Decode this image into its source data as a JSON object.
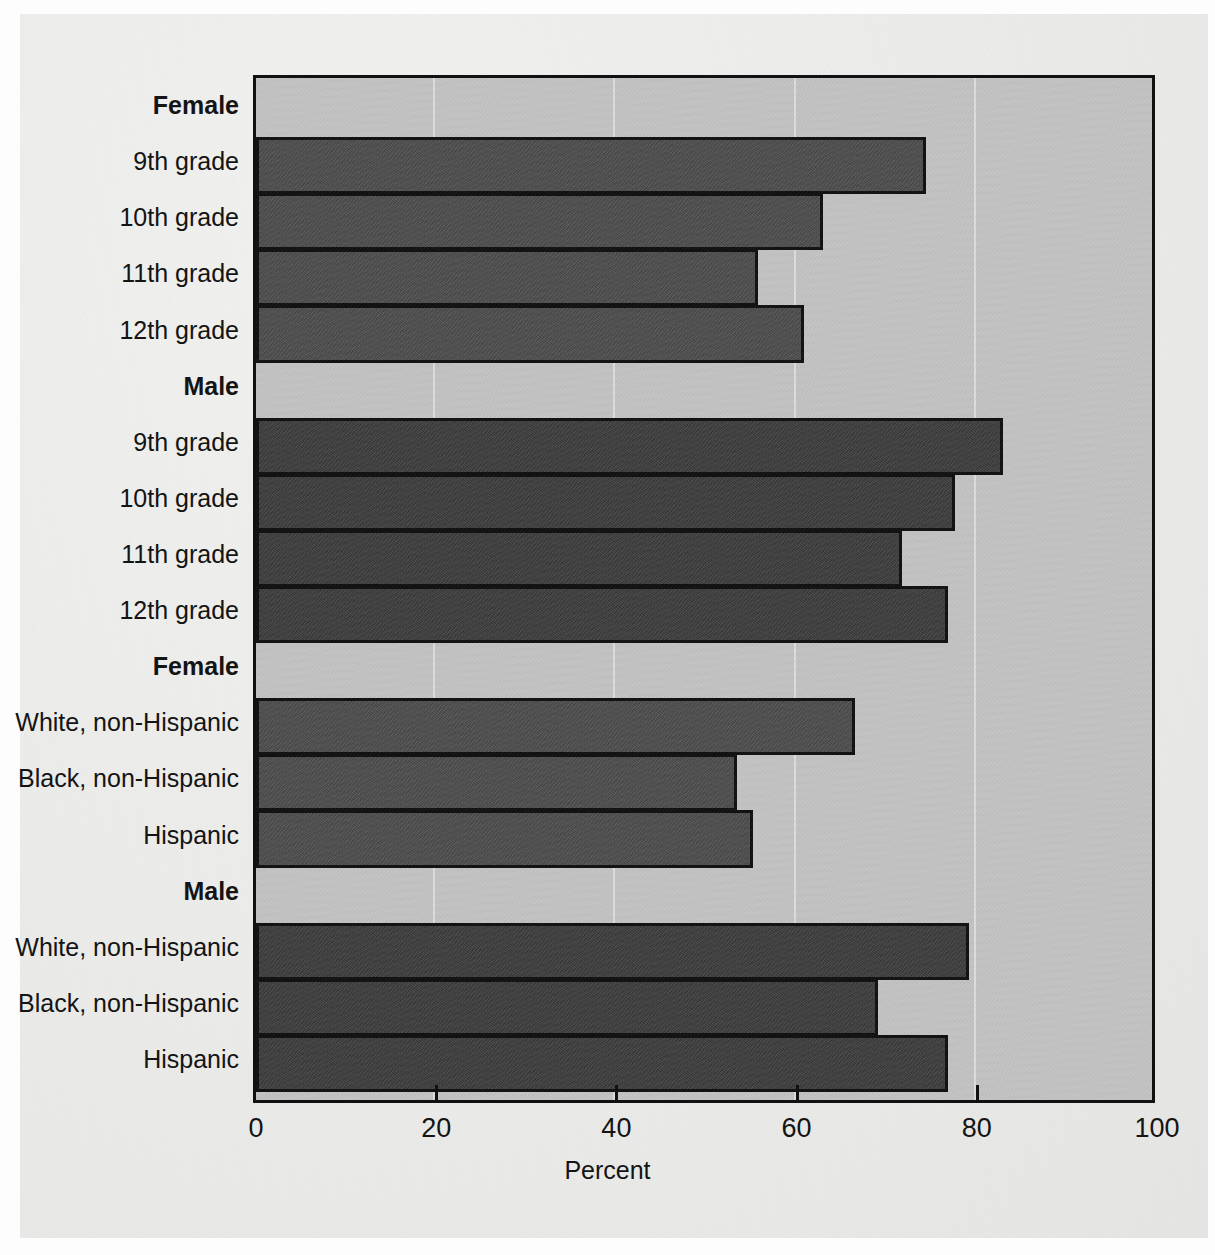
{
  "figure": {
    "axis_title": "Percent",
    "background_color": "#c3c3c3",
    "female_bar_color": "#4b4b4b",
    "male_bar_color": "#3a3a3a"
  },
  "chart_data": {
    "type": "bar",
    "orientation": "horizontal",
    "title": "",
    "subtitle": "",
    "xlabel": "Percent",
    "ylabel": "",
    "xlim": [
      0,
      100
    ],
    "xticks": [
      0,
      20,
      40,
      60,
      80,
      100
    ],
    "xticklabels": [
      "0",
      "20",
      "40",
      "60",
      "80",
      "100"
    ],
    "grid": "vertical",
    "legend": "none",
    "groups": [
      {
        "name": "Female",
        "series": "female",
        "categories": [
          "9th grade",
          "10th grade",
          "11th grade",
          "12th grade"
        ],
        "values": [
          74.0,
          62.6,
          55.4,
          60.5
        ]
      },
      {
        "name": "Male",
        "series": "male",
        "categories": [
          "9th grade",
          "10th grade",
          "11th grade",
          "12th grade"
        ],
        "values": [
          82.6,
          77.3,
          71.4,
          76.5
        ]
      },
      {
        "name": "Female",
        "series": "female",
        "categories": [
          "White, non-Hispanic",
          "Black, non-Hispanic",
          "Hispanic"
        ],
        "values": [
          66.2,
          53.0,
          54.8
        ]
      },
      {
        "name": "Male",
        "series": "male",
        "categories": [
          "White, non-Hispanic",
          "Black, non-Hispanic",
          "Hispanic"
        ],
        "values": [
          78.8,
          68.7,
          76.5
        ]
      }
    ],
    "rows": [
      {
        "label": "Female",
        "kind": "group",
        "series": "female"
      },
      {
        "label": "9th grade",
        "kind": "bar",
        "series": "female",
        "value": 74.0
      },
      {
        "label": "10th grade",
        "kind": "bar",
        "series": "female",
        "value": 62.6
      },
      {
        "label": "11th grade",
        "kind": "bar",
        "series": "female",
        "value": 55.4
      },
      {
        "label": "12th grade",
        "kind": "bar",
        "series": "female",
        "value": 60.5
      },
      {
        "label": "Male",
        "kind": "group",
        "series": "male"
      },
      {
        "label": "9th grade",
        "kind": "bar",
        "series": "male",
        "value": 82.6
      },
      {
        "label": "10th grade",
        "kind": "bar",
        "series": "male",
        "value": 77.3
      },
      {
        "label": "11th grade",
        "kind": "bar",
        "series": "male",
        "value": 71.4
      },
      {
        "label": "12th grade",
        "kind": "bar",
        "series": "male",
        "value": 76.5
      },
      {
        "label": "Female",
        "kind": "group",
        "series": "female"
      },
      {
        "label": "White, non-Hispanic",
        "kind": "bar",
        "series": "female",
        "value": 66.2
      },
      {
        "label": "Black, non-Hispanic",
        "kind": "bar",
        "series": "female",
        "value": 53.0
      },
      {
        "label": "Hispanic",
        "kind": "bar",
        "series": "female",
        "value": 54.8
      },
      {
        "label": "Male",
        "kind": "group",
        "series": "male"
      },
      {
        "label": "White, non-Hispanic",
        "kind": "bar",
        "series": "male",
        "value": 78.8
      },
      {
        "label": "Black, non-Hispanic",
        "kind": "bar",
        "series": "male",
        "value": 68.7
      },
      {
        "label": "Hispanic",
        "kind": "bar",
        "series": "male",
        "value": 76.5
      }
    ]
  }
}
